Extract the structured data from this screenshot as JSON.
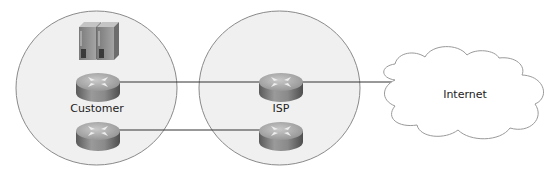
{
  "diagram": {
    "type": "network-topology",
    "zones": [
      {
        "id": "customer",
        "label": "Customer",
        "devices": [
          "server",
          "server",
          "router",
          "router"
        ]
      },
      {
        "id": "isp",
        "label": "ISP",
        "devices": [
          "router",
          "router"
        ]
      }
    ],
    "cloud": {
      "label": "Internet"
    },
    "links": [
      {
        "from": "customer-router-1",
        "to": "isp-router-1"
      },
      {
        "from": "customer-router-2",
        "to": "isp-router-2"
      },
      {
        "from": "isp-router-1",
        "to": "internet"
      }
    ],
    "colors": {
      "zone_fill": "#f0f0f0",
      "zone_stroke": "#8a8a8a",
      "link": "#333333",
      "cloud_stroke": "#9a9a9a",
      "router_body": "#8c8c8c",
      "server_body": "#9a9a9a"
    }
  }
}
